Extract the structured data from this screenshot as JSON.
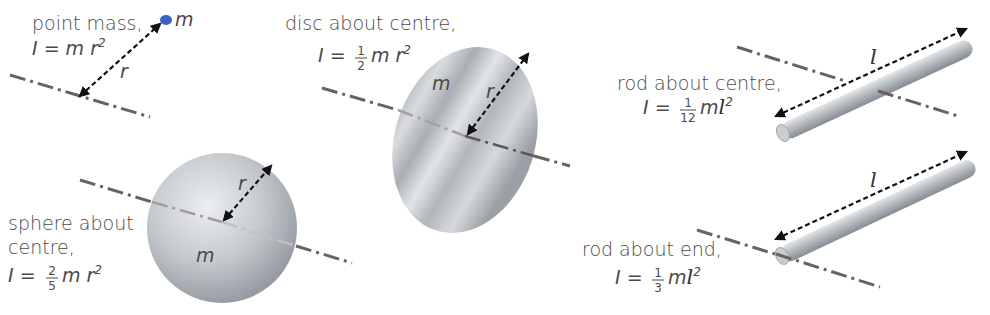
{
  "diagram": {
    "colors": {
      "text": "#4a4a4a",
      "axis": "#6a6262",
      "arrow": "#111111",
      "metal_light": "#e2e4e7",
      "metal_dark": "#8f959c",
      "point_mass": "#3b5fc4"
    },
    "items": [
      {
        "id": "point-mass",
        "label_lines": [
          "point mass,"
        ],
        "formula": {
          "prefix": "I = ",
          "coef_num": "",
          "coef_den": "",
          "body": "m r",
          "exp": "2"
        },
        "mass_label": "m",
        "dimension_label": "r"
      },
      {
        "id": "disc",
        "label_lines": [
          "disc about centre,"
        ],
        "formula": {
          "prefix": "I = ",
          "coef_num": "1",
          "coef_den": "2",
          "body": "m r",
          "exp": "2"
        },
        "mass_label": "m",
        "dimension_label": "r"
      },
      {
        "id": "sphere",
        "label_lines": [
          "sphere about",
          "centre,"
        ],
        "formula": {
          "prefix": "I = ",
          "coef_num": "2",
          "coef_den": "5",
          "body": "m r",
          "exp": "2"
        },
        "mass_label": "m",
        "dimension_label": "r"
      },
      {
        "id": "rod-centre",
        "label_lines": [
          "rod about centre,"
        ],
        "formula": {
          "prefix": "I = ",
          "coef_num": "1",
          "coef_den": "12",
          "body": "m",
          "var": "l",
          "exp": "2"
        },
        "dimension_label": "l"
      },
      {
        "id": "rod-end",
        "label_lines": [
          "rod about end,"
        ],
        "formula": {
          "prefix": "I = ",
          "coef_num": "1",
          "coef_den": "3",
          "body": "m",
          "var": "l",
          "exp": "2"
        },
        "dimension_label": "l"
      }
    ]
  }
}
